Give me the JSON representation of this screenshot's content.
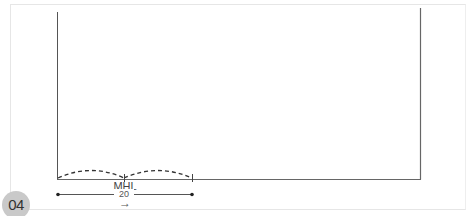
{
  "badge": {
    "label": "04"
  },
  "diagram": {
    "span_label": "MHL",
    "dimension_value": "20",
    "direction_glyph": "→",
    "colors": {
      "line": "#555555",
      "dash": "#333333",
      "frame": "#e6e6e6",
      "badge": "#c9c9c9"
    }
  }
}
